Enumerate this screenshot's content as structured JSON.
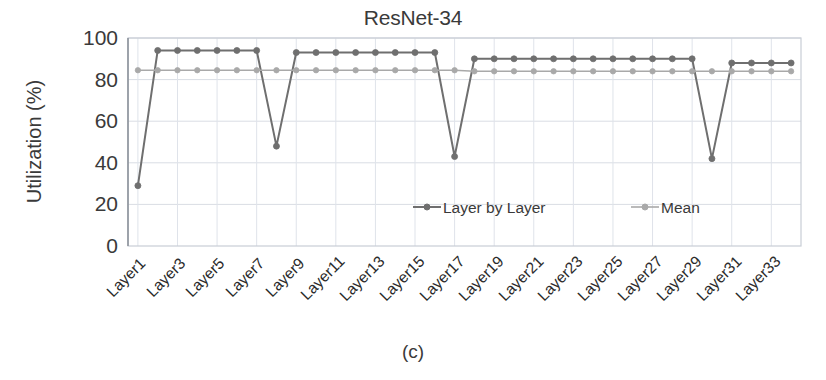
{
  "figure": {
    "title": "ResNet-34",
    "subcaption": "(c)",
    "ylabel": "Utilization (%)"
  },
  "chart_data": {
    "type": "line",
    "title": "ResNet-34",
    "subtitle": "(c)",
    "xlabel": "",
    "ylabel": "Utilization (%)",
    "ylim": [
      0,
      100
    ],
    "yticks": [
      0,
      20,
      40,
      60,
      80,
      100
    ],
    "grid": true,
    "legend_position": "center",
    "categories": [
      "Layer1",
      "Layer2",
      "Layer3",
      "Layer4",
      "Layer5",
      "Layer6",
      "Layer7",
      "Layer8",
      "Layer9",
      "Layer10",
      "Layer11",
      "Layer12",
      "Layer13",
      "Layer14",
      "Layer15",
      "Layer16",
      "Layer17",
      "Layer18",
      "Layer19",
      "Layer20",
      "Layer21",
      "Layer22",
      "Layer23",
      "Layer24",
      "Layer25",
      "Layer26",
      "Layer27",
      "Layer28",
      "Layer29",
      "Layer30",
      "Layer31",
      "Layer32",
      "Layer33",
      "Layer34"
    ],
    "xtick_labels": [
      "Layer1",
      "Layer3",
      "Layer5",
      "Layer7",
      "Layer9",
      "Layer11",
      "Layer13",
      "Layer15",
      "Layer17",
      "Layer19",
      "Layer21",
      "Layer23",
      "Layer25",
      "Layer27",
      "Layer29",
      "Layer31",
      "Layer33"
    ],
    "series": [
      {
        "name": "Layer by Layer",
        "color": "#6f6f6f",
        "marker": "circle",
        "values": [
          29,
          94,
          94,
          94,
          94,
          94,
          94,
          48,
          93,
          93,
          93,
          93,
          93,
          93,
          93,
          93,
          43,
          90,
          90,
          90,
          90,
          90,
          90,
          90,
          90,
          90,
          90,
          90,
          90,
          42,
          88,
          88,
          88,
          88
        ]
      },
      {
        "name": "Mean",
        "color": "#a9a9a9",
        "marker": "circle",
        "values": [
          84.5,
          84.5,
          84.5,
          84.5,
          84.5,
          84.5,
          84.5,
          84.5,
          84.5,
          84.5,
          84.5,
          84.5,
          84.5,
          84.5,
          84.5,
          84.5,
          84.5,
          84.0,
          84.0,
          84.0,
          84.0,
          84.0,
          84.0,
          84.0,
          84.0,
          84.0,
          84.0,
          84.0,
          84.0,
          84.0,
          84.0,
          84.0,
          84.0,
          84.0
        ]
      }
    ]
  },
  "legend": {
    "items": [
      {
        "label": "Layer by Layer",
        "color": "#6f6f6f"
      },
      {
        "label": "Mean",
        "color": "#a9a9a9"
      }
    ]
  }
}
